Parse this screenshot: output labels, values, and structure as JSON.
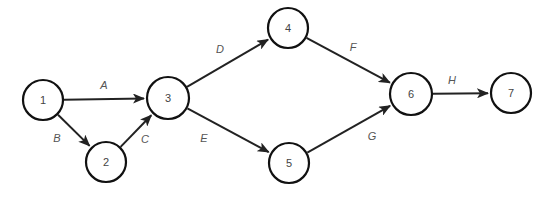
{
  "diagram": {
    "type": "activity-on-arrow network",
    "nodes": [
      {
        "id": "1",
        "label": "1",
        "x": 43,
        "y": 100,
        "r": 20
      },
      {
        "id": "2",
        "label": "2",
        "x": 106,
        "y": 162,
        "r": 20
      },
      {
        "id": "3",
        "label": "3",
        "x": 168,
        "y": 98,
        "r": 21
      },
      {
        "id": "4",
        "label": "4",
        "x": 288,
        "y": 28,
        "r": 20
      },
      {
        "id": "5",
        "label": "5",
        "x": 289,
        "y": 163,
        "r": 20
      },
      {
        "id": "6",
        "label": "6",
        "x": 411,
        "y": 94,
        "r": 21
      },
      {
        "id": "7",
        "label": "7",
        "x": 511,
        "y": 93,
        "r": 20
      }
    ],
    "edges": [
      {
        "id": "A",
        "label": "A",
        "from": "1",
        "to": "3",
        "lx": 104,
        "ly": 85
      },
      {
        "id": "B",
        "label": "B",
        "from": "1",
        "to": "2",
        "lx": 57,
        "ly": 138
      },
      {
        "id": "C",
        "label": "C",
        "from": "2",
        "to": "3",
        "lx": 145,
        "ly": 139
      },
      {
        "id": "D",
        "label": "D",
        "from": "3",
        "to": "4",
        "lx": 220,
        "ly": 49
      },
      {
        "id": "E",
        "label": "E",
        "from": "3",
        "to": "5",
        "lx": 204,
        "ly": 138
      },
      {
        "id": "F",
        "label": "F",
        "from": "4",
        "to": "6",
        "lx": 353,
        "ly": 47
      },
      {
        "id": "G",
        "label": "G",
        "from": "5",
        "to": "6",
        "lx": 372,
        "ly": 136
      },
      {
        "id": "H",
        "label": "H",
        "from": "6",
        "to": "7",
        "lx": 452,
        "ly": 80
      }
    ]
  }
}
